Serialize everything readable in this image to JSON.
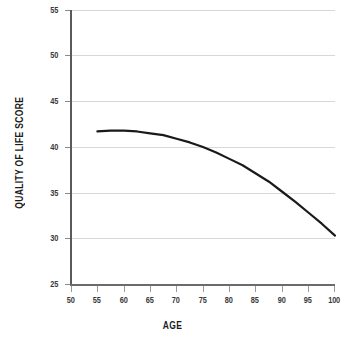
{
  "chart_data": {
    "type": "line",
    "title": "",
    "xlabel": "AGE",
    "ylabel": "QUALITY OF LIFE SCORE",
    "xlim": [
      50,
      100
    ],
    "ylim": [
      25,
      55
    ],
    "xticks": [
      50,
      55,
      60,
      65,
      70,
      75,
      80,
      85,
      90,
      95,
      100
    ],
    "yticks": [
      25,
      30,
      35,
      40,
      45,
      50,
      55
    ],
    "xtick_labels": [
      "50",
      "55",
      "60",
      "65",
      "70",
      "75",
      "80",
      "85",
      "90",
      "95",
      "100"
    ],
    "ytick_labels": [
      "25",
      "30",
      "35",
      "40",
      "45",
      "50",
      "55"
    ],
    "grid": "horizontal",
    "legend": "none",
    "series": [
      {
        "name": "Quality of life score",
        "color": "#1a1a1a",
        "x": [
          55,
          57.5,
          60,
          62.5,
          65,
          67.5,
          70,
          72.5,
          75,
          77.5,
          80,
          82.5,
          85,
          87.5,
          90,
          92.5,
          95,
          97.5,
          100
        ],
        "values": [
          41.7,
          41.8,
          41.8,
          41.7,
          41.5,
          41.3,
          40.9,
          40.5,
          40.0,
          39.4,
          38.7,
          38.0,
          37.1,
          36.2,
          35.1,
          34.0,
          32.8,
          31.6,
          30.3
        ]
      }
    ]
  },
  "axes": {
    "grid_color": "#d8d8d8",
    "spine_color": "#5a5a5a",
    "tick_color": "#9a9a9a",
    "label_color": "#1c1c1c"
  }
}
